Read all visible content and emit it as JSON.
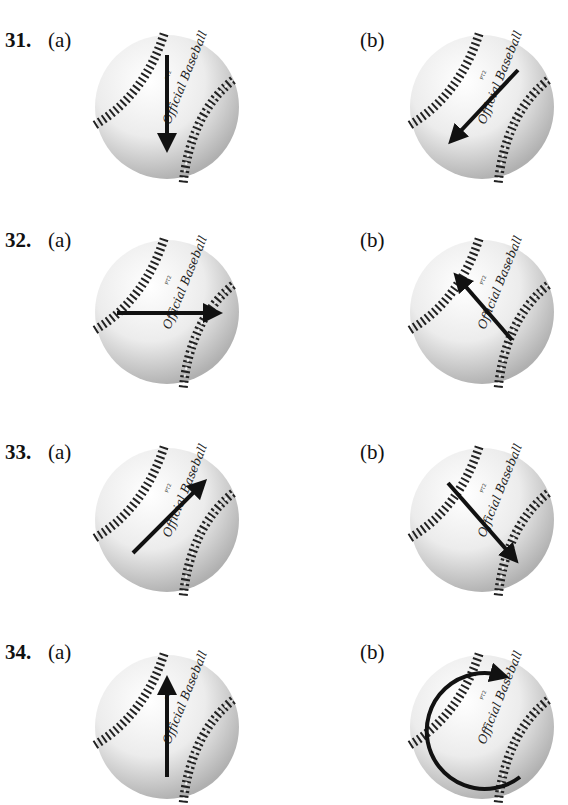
{
  "problems": [
    {
      "number": "31.",
      "a_label": "(a)",
      "b_label": "(b)",
      "a_arrow": "down",
      "b_arrow": "down-left"
    },
    {
      "number": "32.",
      "a_label": "(a)",
      "b_label": "(b)",
      "a_arrow": "right",
      "b_arrow": "up-left"
    },
    {
      "number": "33.",
      "a_label": "(a)",
      "b_label": "(b)",
      "a_arrow": "up-right",
      "b_arrow": "down-right"
    },
    {
      "number": "34.",
      "a_label": "(a)",
      "b_label": "(b)",
      "a_arrow": "up",
      "b_arrow": "clockwise-rotation"
    }
  ],
  "ball_text": {
    "brand": "Official Baseball",
    "mark": "PT2"
  },
  "colors": {
    "ball_light": "#ffffff",
    "ball_shadow": "#b8b8b8",
    "stitch": "#222222",
    "arrow": "#111111"
  }
}
